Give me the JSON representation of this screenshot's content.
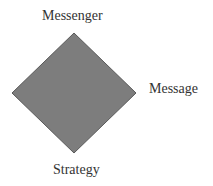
{
  "diagram": {
    "shape": "diamond",
    "fill_color": "#7d7d7d",
    "stroke_color": "#5a5a5a",
    "labels": {
      "top": "Messenger",
      "right": "Message",
      "bottom": "Strategy"
    }
  }
}
